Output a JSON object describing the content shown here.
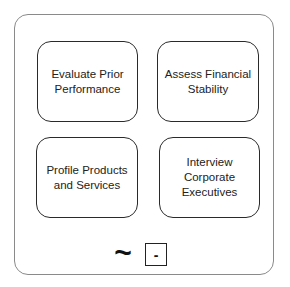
{
  "diagram": {
    "cards": [
      {
        "label": "Evaluate Prior Performance"
      },
      {
        "label": "Assess Financial Stability"
      },
      {
        "label": "Profile Products and Services"
      },
      {
        "label": "Interview Corporate Executives"
      }
    ],
    "controls": {
      "tilde_icon": "~",
      "minus_label": "-"
    }
  }
}
